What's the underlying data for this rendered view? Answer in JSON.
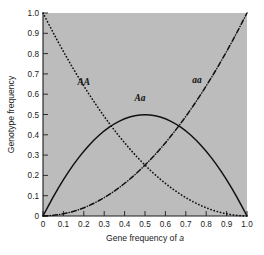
{
  "chart_data": {
    "type": "line",
    "title": "",
    "xlabel": "Gene frequency of a",
    "xlabel_plain": "Gene frequency of",
    "xlabel_italic": "a",
    "ylabel": "Genotype frequency",
    "xlim": [
      0,
      1
    ],
    "ylim": [
      0,
      1
    ],
    "grid": false,
    "legend_position": "inline-annotations",
    "background_color": "#bcbcbc",
    "line_color": "#111111",
    "xticks": [
      "0",
      "0.1",
      "0.2",
      "0.3",
      "0.4",
      "0.5",
      "0.6",
      "0.7",
      "0.8",
      "0.9",
      "1.0"
    ],
    "xtick_values": [
      0,
      0.1,
      0.2,
      0.3,
      0.4,
      0.5,
      0.6,
      0.7,
      0.8,
      0.9,
      1.0
    ],
    "yticks": [
      "0",
      "0.1",
      "0.2",
      "0.3",
      "0.4",
      "0.5",
      "0.6",
      "0.7",
      "0.8",
      "0.9",
      "1.0"
    ],
    "ytick_values": [
      0,
      0.1,
      0.2,
      0.3,
      0.4,
      0.5,
      0.6,
      0.7,
      0.8,
      0.9,
      1.0
    ],
    "x": [
      0,
      0.05,
      0.1,
      0.15,
      0.2,
      0.25,
      0.3,
      0.35,
      0.4,
      0.45,
      0.5,
      0.55,
      0.6,
      0.65,
      0.7,
      0.75,
      0.8,
      0.85,
      0.9,
      0.95,
      1.0
    ],
    "series": [
      {
        "name": "AA",
        "label": "AA",
        "formula": "(1-q)^2",
        "style": "dotted",
        "values": [
          1.0,
          0.9025,
          0.81,
          0.7225,
          0.64,
          0.5625,
          0.49,
          0.4225,
          0.36,
          0.3025,
          0.25,
          0.2025,
          0.16,
          0.1225,
          0.09,
          0.0625,
          0.04,
          0.0225,
          0.01,
          0.0025,
          0.0
        ],
        "label_x": 0.2,
        "label_y": 0.645
      },
      {
        "name": "Aa",
        "label": "Aa",
        "formula": "2q(1-q)",
        "style": "solid",
        "values": [
          0.0,
          0.095,
          0.18,
          0.255,
          0.32,
          0.375,
          0.42,
          0.455,
          0.48,
          0.495,
          0.5,
          0.495,
          0.48,
          0.455,
          0.42,
          0.375,
          0.32,
          0.255,
          0.18,
          0.095,
          0.0
        ],
        "label_x": 0.475,
        "label_y": 0.565
      },
      {
        "name": "aa",
        "label": "aa",
        "formula": "q^2",
        "style": "dash-dot",
        "values": [
          0.0,
          0.0025,
          0.01,
          0.0225,
          0.04,
          0.0625,
          0.09,
          0.1225,
          0.16,
          0.2025,
          0.25,
          0.3025,
          0.36,
          0.4225,
          0.49,
          0.5625,
          0.64,
          0.7225,
          0.81,
          0.9025,
          1.0
        ],
        "label_x": 0.755,
        "label_y": 0.655
      }
    ]
  }
}
